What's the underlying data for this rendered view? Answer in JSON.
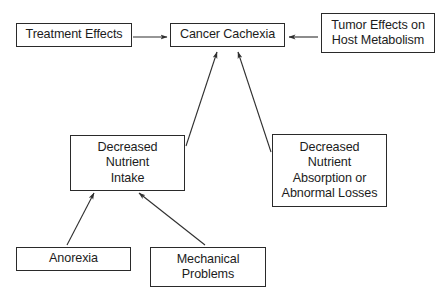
{
  "diagram": {
    "type": "flowchart",
    "nodes": [
      {
        "id": "treatment-effects",
        "label": "Treatment Effects",
        "box": [
          16,
          23,
          116,
          24
        ]
      },
      {
        "id": "cancer-cachexia",
        "label": "Cancer Cachexia",
        "box": [
          170,
          23,
          115,
          24
        ]
      },
      {
        "id": "tumor-effects",
        "label": "Tumor Effects on\nHost Metabolism",
        "box": [
          321,
          13,
          114,
          40
        ]
      },
      {
        "id": "decreased-nutrient-intake",
        "label": "Decreased\nNutrient\nIntake",
        "box": [
          70,
          135,
          115,
          56
        ]
      },
      {
        "id": "decreased-nutrient-absorption",
        "label": "Decreased\nNutrient\nAbsorption or\nAbnormal Losses",
        "box": [
          272,
          134,
          115,
          73
        ]
      },
      {
        "id": "anorexia",
        "label": "Anorexia",
        "box": [
          16,
          247,
          115,
          24
        ]
      },
      {
        "id": "mechanical-problems",
        "label": "Mechanical\nProblems",
        "box": [
          150,
          247,
          116,
          40
        ]
      }
    ],
    "edges": [
      {
        "from": "treatment-effects",
        "to": "cancer-cachexia",
        "x1": 133,
        "y1": 37,
        "x2": 167,
        "y2": 37
      },
      {
        "from": "tumor-effects",
        "to": "cancer-cachexia",
        "x1": 318,
        "y1": 37,
        "x2": 289,
        "y2": 37
      },
      {
        "from": "decreased-nutrient-intake",
        "to": "cancer-cachexia",
        "x1": 186,
        "y1": 146,
        "x2": 217,
        "y2": 52
      },
      {
        "from": "decreased-nutrient-absorption",
        "to": "cancer-cachexia",
        "x1": 271,
        "y1": 152,
        "x2": 238,
        "y2": 52
      },
      {
        "from": "anorexia",
        "to": "decreased-nutrient-intake",
        "x1": 67,
        "y1": 245,
        "x2": 94,
        "y2": 193
      },
      {
        "from": "mechanical-problems",
        "to": "decreased-nutrient-intake",
        "x1": 205,
        "y1": 245,
        "x2": 139,
        "y2": 193
      }
    ],
    "colors": {
      "line": "#2f2f2f",
      "text": "#1c1c1c",
      "background": "#ffffff"
    }
  }
}
